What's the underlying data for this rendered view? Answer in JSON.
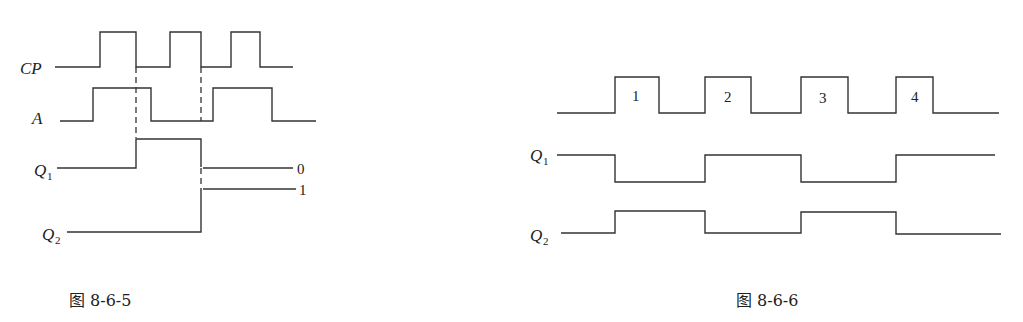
{
  "figure_left": {
    "caption": "图 8-6-5",
    "signals": [
      {
        "name": "CP",
        "label_main": "CP",
        "label_sub": ""
      },
      {
        "name": "A",
        "label_main": "A",
        "label_sub": ""
      },
      {
        "name": "Q1",
        "label_main": "Q",
        "label_sub": "1"
      },
      {
        "name": "Q2",
        "label_main": "Q",
        "label_sub": "2"
      }
    ],
    "end_labels": [
      "0",
      "1"
    ]
  },
  "figure_right": {
    "caption": "图 8-6-6",
    "signals": [
      {
        "name": "CP",
        "label_main": "",
        "label_sub": ""
      },
      {
        "name": "Q1",
        "label_main": "Q",
        "label_sub": "1"
      },
      {
        "name": "Q2",
        "label_main": "Q",
        "label_sub": "2"
      }
    ],
    "pulse_numbers": [
      "1",
      "2",
      "3",
      "4"
    ]
  }
}
